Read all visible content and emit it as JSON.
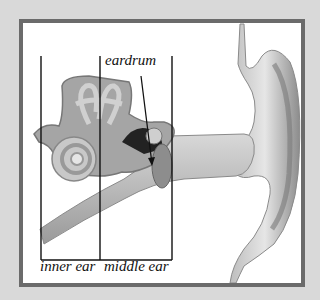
{
  "diagram": {
    "labels": {
      "eardrum": "eardrum",
      "inner_ear": "inner ear",
      "middle_ear": "middle ear"
    },
    "colors": {
      "frame": "#6b6b6b",
      "background": "#d9d9d9",
      "ink": "#111111"
    }
  }
}
